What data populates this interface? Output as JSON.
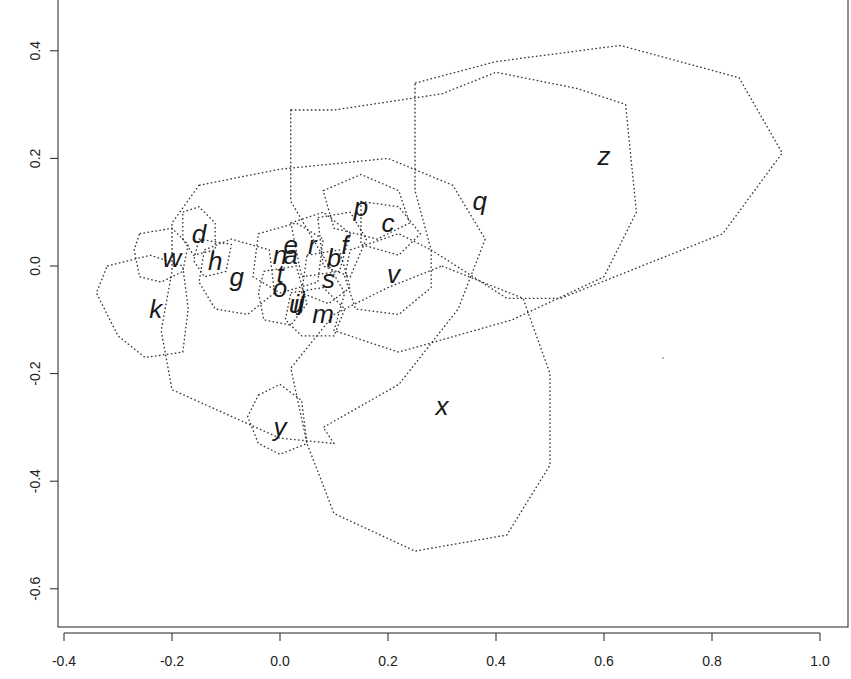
{
  "chart_data": {
    "type": "scatter",
    "title": "",
    "xlabel": "",
    "ylabel": "",
    "xlim": [
      -0.42,
      1.05
    ],
    "ylim": [
      -0.67,
      0.46
    ],
    "grid": false,
    "legend": null,
    "x_ticks": [
      -0.4,
      -0.2,
      0.0,
      0.2,
      0.4,
      0.6,
      0.8,
      1.0
    ],
    "x_tick_labels": [
      "-0.4",
      "-0.2",
      "0.0",
      "0.2",
      "0.4",
      "0.6",
      "0.8",
      "1.0"
    ],
    "y_ticks": [
      0.4,
      0.2,
      0.0,
      -0.2,
      -0.4,
      -0.6
    ],
    "y_tick_labels": [
      "0.4",
      "0.2",
      "0.0",
      "-0.2",
      "-0.4",
      "-0.6"
    ],
    "points": [
      {
        "label": "a",
        "x": 0.02,
        "y": 0.02
      },
      {
        "label": "b",
        "x": 0.1,
        "y": 0.015
      },
      {
        "label": "c",
        "x": 0.2,
        "y": 0.08
      },
      {
        "label": "d",
        "x": -0.15,
        "y": 0.06
      },
      {
        "label": "e",
        "x": 0.02,
        "y": 0.04
      },
      {
        "label": "f",
        "x": 0.12,
        "y": 0.04
      },
      {
        "label": "g",
        "x": -0.08,
        "y": -0.02
      },
      {
        "label": "h",
        "x": -0.12,
        "y": 0.01
      },
      {
        "label": "i",
        "x": 0.03,
        "y": -0.07
      },
      {
        "label": "j",
        "x": 0.04,
        "y": -0.065
      },
      {
        "label": "k",
        "x": -0.23,
        "y": -0.08
      },
      {
        "label": "l",
        "x": 0.04,
        "y": -0.07
      },
      {
        "label": "m",
        "x": 0.08,
        "y": -0.09
      },
      {
        "label": "n",
        "x": 0.0,
        "y": 0.02
      },
      {
        "label": "o",
        "x": 0.0,
        "y": -0.04
      },
      {
        "label": "p",
        "x": 0.15,
        "y": 0.11
      },
      {
        "label": "q",
        "x": 0.37,
        "y": 0.12
      },
      {
        "label": "r",
        "x": 0.06,
        "y": 0.04
      },
      {
        "label": "s",
        "x": 0.09,
        "y": -0.025
      },
      {
        "label": "t",
        "x": 0.0,
        "y": -0.015
      },
      {
        "label": "u",
        "x": 0.03,
        "y": -0.07
      },
      {
        "label": "v",
        "x": 0.21,
        "y": -0.015
      },
      {
        "label": "w",
        "x": -0.2,
        "y": 0.015
      },
      {
        "label": "x",
        "x": 0.3,
        "y": -0.26
      },
      {
        "label": "y",
        "x": 0.0,
        "y": -0.3
      },
      {
        "label": "z",
        "x": 0.6,
        "y": 0.205
      }
    ],
    "hulls": [
      {
        "label": "z",
        "points": [
          [
            0.25,
            0.34
          ],
          [
            0.4,
            0.38
          ],
          [
            0.63,
            0.41
          ],
          [
            0.85,
            0.35
          ],
          [
            0.93,
            0.21
          ],
          [
            0.82,
            0.06
          ],
          [
            0.52,
            -0.06
          ],
          [
            0.42,
            -0.06
          ],
          [
            0.28,
            0.03
          ],
          [
            0.25,
            0.14
          ]
        ]
      },
      {
        "label": "q",
        "points": [
          [
            0.02,
            0.29
          ],
          [
            0.1,
            0.29
          ],
          [
            0.3,
            0.32
          ],
          [
            0.4,
            0.36
          ],
          [
            0.55,
            0.33
          ],
          [
            0.64,
            0.3
          ],
          [
            0.66,
            0.1
          ],
          [
            0.6,
            -0.02
          ],
          [
            0.43,
            -0.1
          ],
          [
            0.22,
            -0.16
          ],
          [
            0.1,
            -0.12
          ],
          [
            0.12,
            -0.05
          ],
          [
            0.02,
            0.12
          ]
        ]
      },
      {
        "label": "big-center",
        "points": [
          [
            -0.15,
            0.15
          ],
          [
            0.0,
            0.18
          ],
          [
            0.2,
            0.2
          ],
          [
            0.32,
            0.15
          ],
          [
            0.38,
            0.05
          ],
          [
            0.33,
            -0.08
          ],
          [
            0.22,
            -0.22
          ],
          [
            0.08,
            -0.3
          ],
          [
            0.1,
            -0.33
          ],
          [
            0.0,
            -0.32
          ],
          [
            -0.2,
            -0.23
          ],
          [
            -0.22,
            -0.12
          ],
          [
            -0.2,
            -0.01
          ],
          [
            -0.2,
            0.08
          ]
        ]
      },
      {
        "label": "x",
        "points": [
          [
            0.3,
            0.0
          ],
          [
            0.45,
            -0.06
          ],
          [
            0.5,
            -0.2
          ],
          [
            0.5,
            -0.37
          ],
          [
            0.42,
            -0.5
          ],
          [
            0.25,
            -0.53
          ],
          [
            0.1,
            -0.46
          ],
          [
            0.05,
            -0.33
          ],
          [
            0.02,
            -0.19
          ],
          [
            0.1,
            -0.09
          ],
          [
            0.2,
            -0.04
          ]
        ]
      },
      {
        "label": "k",
        "points": [
          [
            -0.32,
            0.0
          ],
          [
            -0.24,
            0.02
          ],
          [
            -0.18,
            0.0
          ],
          [
            -0.17,
            -0.08
          ],
          [
            -0.18,
            -0.16
          ],
          [
            -0.25,
            -0.17
          ],
          [
            -0.3,
            -0.13
          ],
          [
            -0.34,
            -0.05
          ]
        ]
      },
      {
        "label": "w",
        "points": [
          [
            -0.26,
            0.06
          ],
          [
            -0.2,
            0.07
          ],
          [
            -0.17,
            0.04
          ],
          [
            -0.18,
            -0.01
          ],
          [
            -0.22,
            -0.03
          ],
          [
            -0.26,
            -0.02
          ],
          [
            -0.27,
            0.03
          ]
        ]
      },
      {
        "label": "d",
        "points": [
          [
            -0.18,
            0.1
          ],
          [
            -0.15,
            0.11
          ],
          [
            -0.12,
            0.08
          ],
          [
            -0.12,
            0.03
          ],
          [
            -0.16,
            0.02
          ],
          [
            -0.18,
            0.05
          ]
        ]
      },
      {
        "label": "h",
        "points": [
          [
            -0.15,
            0.05
          ],
          [
            -0.09,
            0.04
          ],
          [
            -0.1,
            -0.01
          ],
          [
            -0.14,
            -0.02
          ],
          [
            -0.16,
            0.01
          ]
        ]
      },
      {
        "label": "g",
        "points": [
          [
            -0.14,
            0.03
          ],
          [
            -0.09,
            0.05
          ],
          [
            -0.02,
            0.03
          ],
          [
            -0.01,
            -0.05
          ],
          [
            -0.06,
            -0.09
          ],
          [
            -0.12,
            -0.08
          ],
          [
            -0.15,
            -0.03
          ]
        ]
      },
      {
        "label": "y",
        "points": [
          [
            -0.04,
            -0.24
          ],
          [
            0.0,
            -0.22
          ],
          [
            0.04,
            -0.25
          ],
          [
            0.05,
            -0.33
          ],
          [
            0.0,
            -0.35
          ],
          [
            -0.04,
            -0.33
          ],
          [
            -0.06,
            -0.28
          ]
        ]
      },
      {
        "label": "v",
        "points": [
          [
            0.13,
            0.03
          ],
          [
            0.22,
            0.06
          ],
          [
            0.28,
            0.03
          ],
          [
            0.28,
            -0.04
          ],
          [
            0.22,
            -0.09
          ],
          [
            0.14,
            -0.08
          ],
          [
            0.12,
            -0.02
          ]
        ]
      },
      {
        "label": "p",
        "points": [
          [
            0.08,
            0.14
          ],
          [
            0.15,
            0.17
          ],
          [
            0.22,
            0.14
          ],
          [
            0.24,
            0.08
          ],
          [
            0.18,
            0.05
          ],
          [
            0.1,
            0.07
          ]
        ]
      },
      {
        "label": "c",
        "points": [
          [
            0.15,
            0.12
          ],
          [
            0.22,
            0.11
          ],
          [
            0.26,
            0.06
          ],
          [
            0.22,
            0.02
          ],
          [
            0.15,
            0.04
          ]
        ]
      },
      {
        "label": "a",
        "points": [
          [
            -0.04,
            0.06
          ],
          [
            0.03,
            0.08
          ],
          [
            0.08,
            0.05
          ],
          [
            0.07,
            -0.03
          ],
          [
            0.0,
            -0.05
          ],
          [
            -0.05,
            -0.02
          ]
        ]
      },
      {
        "label": "r",
        "points": [
          [
            0.02,
            0.08
          ],
          [
            0.08,
            0.1
          ],
          [
            0.13,
            0.06
          ],
          [
            0.11,
            -0.01
          ],
          [
            0.04,
            -0.02
          ]
        ]
      },
      {
        "label": "f",
        "points": [
          [
            0.07,
            0.09
          ],
          [
            0.13,
            0.1
          ],
          [
            0.16,
            0.05
          ],
          [
            0.13,
            -0.02
          ],
          [
            0.08,
            0.0
          ]
        ]
      },
      {
        "label": "s",
        "points": [
          [
            0.05,
            0.02
          ],
          [
            0.11,
            0.03
          ],
          [
            0.13,
            -0.04
          ],
          [
            0.09,
            -0.07
          ],
          [
            0.04,
            -0.05
          ]
        ]
      },
      {
        "label": "o",
        "points": [
          [
            -0.03,
            -0.01
          ],
          [
            0.03,
            0.0
          ],
          [
            0.05,
            -0.07
          ],
          [
            0.02,
            -0.11
          ],
          [
            -0.03,
            -0.1
          ],
          [
            -0.04,
            -0.05
          ]
        ]
      },
      {
        "label": "m",
        "points": [
          [
            0.02,
            -0.05
          ],
          [
            0.08,
            -0.04
          ],
          [
            0.12,
            -0.08
          ],
          [
            0.1,
            -0.13
          ],
          [
            0.04,
            -0.13
          ],
          [
            0.01,
            -0.1
          ]
        ]
      }
    ]
  }
}
